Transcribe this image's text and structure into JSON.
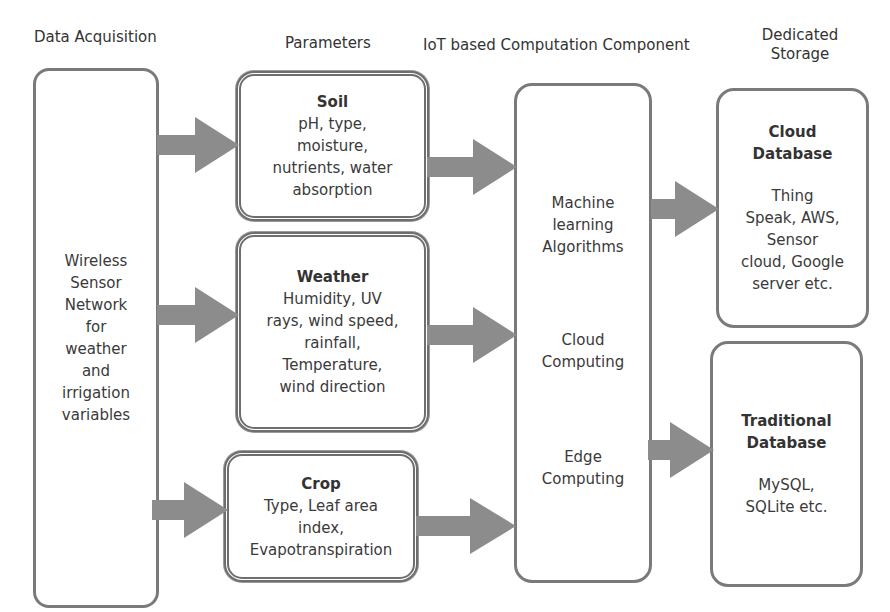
{
  "headers": {
    "data_acquisition": "Data Acquisition",
    "parameters": "Parameters",
    "computation": "IoT based Computation Component",
    "storage_line1": "Dedicated",
    "storage_line2": "Storage"
  },
  "acquisition": {
    "lines": [
      "Wireless",
      "Sensor",
      "Network",
      "for",
      "weather",
      "and",
      "irrigation",
      "variables"
    ]
  },
  "parameters": [
    {
      "title": "Soil",
      "lines": [
        "pH, type,",
        "moisture,",
        "nutrients, water",
        "absorption"
      ]
    },
    {
      "title": "Weather",
      "lines": [
        "Humidity, UV",
        "rays, wind speed,",
        "rainfall,",
        "Temperature,",
        "wind direction"
      ]
    },
    {
      "title": "Crop",
      "lines": [
        "Type, Leaf area",
        "index,",
        "Evapotranspiration"
      ]
    }
  ],
  "computation": {
    "items": [
      {
        "lines": [
          "Machine",
          "learning",
          "Algorithms"
        ]
      },
      {
        "lines": [
          "Cloud",
          "Computing"
        ]
      },
      {
        "lines": [
          "Edge",
          "Computing"
        ]
      }
    ]
  },
  "storage": [
    {
      "title_lines": [
        "Cloud",
        "Database"
      ],
      "lines": [
        "Thing",
        "Speak, AWS,",
        "Sensor",
        "cloud, Google",
        "server etc."
      ]
    },
    {
      "title_lines": [
        "Traditional",
        "Database"
      ],
      "lines": [
        "MySQL,",
        "SQLite etc."
      ]
    }
  ],
  "colors": {
    "border": "#7a7a7a",
    "arrow": "#8c8c8c",
    "text": "#333333"
  }
}
